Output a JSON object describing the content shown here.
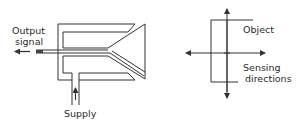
{
  "diagram": {
    "left": {
      "name": "fluidic proximity sensor",
      "labels": {
        "output_line1": "Output",
        "output_line2": "signal",
        "supply": "Supply"
      }
    },
    "right": {
      "name": "sensing directions diagram",
      "labels": {
        "object": "Object",
        "sensing_line1": "Sensing",
        "sensing_line2": "directions"
      }
    },
    "colors": {
      "line": "#333333",
      "text": "#2a2a2a",
      "background": "#ffffff"
    }
  }
}
